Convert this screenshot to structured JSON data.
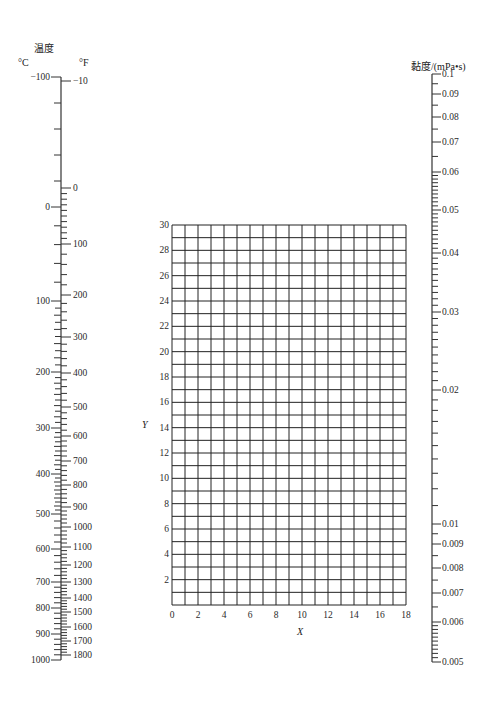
{
  "chart_data": [
    {
      "type": "nomogram-scale",
      "name": "temperature",
      "title": "温度",
      "units": [
        "°C",
        "°F"
      ],
      "celsius_ticks": [
        {
          "label": "−100",
          "value": -100,
          "y": 77
        },
        {
          "label": "0",
          "value": 0,
          "y": 207
        },
        {
          "label": "100",
          "value": 100,
          "y": 301
        },
        {
          "label": "200",
          "value": 200,
          "y": 372
        },
        {
          "label": "300",
          "value": 300,
          "y": 428
        },
        {
          "label": "400",
          "value": 400,
          "y": 474
        },
        {
          "label": "500",
          "value": 500,
          "y": 514
        },
        {
          "label": "600",
          "value": 600,
          "y": 549
        },
        {
          "label": "700",
          "value": 700,
          "y": 582
        },
        {
          "label": "800",
          "value": 800,
          "y": 608
        },
        {
          "label": "900",
          "value": 900,
          "y": 634
        },
        {
          "label": "1000",
          "value": 1000,
          "y": 660
        }
      ],
      "fahrenheit_ticks": [
        {
          "label": "−10",
          "value": -10,
          "y": 81
        },
        {
          "label": "0",
          "value": 0,
          "y": 188
        },
        {
          "label": "100",
          "value": 100,
          "y": 244
        },
        {
          "label": "200",
          "value": 200,
          "y": 295
        },
        {
          "label": "300",
          "value": 300,
          "y": 337
        },
        {
          "label": "400",
          "value": 400,
          "y": 373
        },
        {
          "label": "500",
          "value": 500,
          "y": 407
        },
        {
          "label": "600",
          "value": 600,
          "y": 436
        },
        {
          "label": "700",
          "value": 700,
          "y": 461
        },
        {
          "label": "800",
          "value": 800,
          "y": 485
        },
        {
          "label": "900",
          "value": 900,
          "y": 507
        },
        {
          "label": "1000",
          "value": 1000,
          "y": 527
        },
        {
          "label": "1100",
          "value": 1100,
          "y": 547
        },
        {
          "label": "1200",
          "value": 1200,
          "y": 565
        },
        {
          "label": "1300",
          "value": 1300,
          "y": 582
        },
        {
          "label": "1400",
          "value": 1400,
          "y": 598
        },
        {
          "label": "1500",
          "value": 1500,
          "y": 612
        },
        {
          "label": "1600",
          "value": 1600,
          "y": 627
        },
        {
          "label": "1700",
          "value": 1700,
          "y": 641
        },
        {
          "label": "1800",
          "value": 1800,
          "y": 655
        }
      ]
    },
    {
      "type": "grid",
      "name": "xy-coordinate-grid",
      "xlabel": "X",
      "ylabel": "Y",
      "xlim": [
        0,
        18
      ],
      "ylim": [
        0,
        30
      ],
      "x_ticks": [
        "0",
        "2",
        "4",
        "6",
        "8",
        "10",
        "12",
        "14",
        "16",
        "18"
      ],
      "y_ticks": [
        "2",
        "4",
        "6",
        "8",
        "10",
        "12",
        "14",
        "16",
        "18",
        "20",
        "22",
        "24",
        "26",
        "28",
        "30"
      ],
      "grid": true,
      "grid_step": 1
    },
    {
      "type": "nomogram-scale",
      "name": "viscosity",
      "title": "黏度/(mPa•s)",
      "ticks": [
        {
          "label": "0.1",
          "value": 0.1,
          "y": 74
        },
        {
          "label": "0.09",
          "value": 0.09,
          "y": 94
        },
        {
          "label": "0.08",
          "value": 0.08,
          "y": 117
        },
        {
          "label": "0.07",
          "value": 0.07,
          "y": 142
        },
        {
          "label": "0.06",
          "value": 0.06,
          "y": 172
        },
        {
          "label": "0.05",
          "value": 0.05,
          "y": 210
        },
        {
          "label": "0.04",
          "value": 0.04,
          "y": 253
        },
        {
          "label": "0.03",
          "value": 0.03,
          "y": 312
        },
        {
          "label": "0.02",
          "value": 0.02,
          "y": 390
        },
        {
          "label": "0.01",
          "value": 0.01,
          "y": 524
        },
        {
          "label": "0.009",
          "value": 0.009,
          "y": 544
        },
        {
          "label": "0.008",
          "value": 0.008,
          "y": 568
        },
        {
          "label": "0.007",
          "value": 0.007,
          "y": 593
        },
        {
          "label": "0.006",
          "value": 0.006,
          "y": 622
        },
        {
          "label": "0.005",
          "value": 0.005,
          "y": 662
        }
      ]
    }
  ],
  "temperature_scale": {
    "title": "温度",
    "unit_c": "°C",
    "unit_f": "°F"
  },
  "viscosity_scale": {
    "title": "黏度/(mPa•s)"
  },
  "grid_chart": {
    "xlabel": "X",
    "ylabel": "Y"
  }
}
